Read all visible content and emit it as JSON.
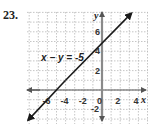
{
  "problem_number": "23.",
  "chart_data": {
    "type": "line",
    "title": "",
    "equation_label": "x − y = -5",
    "xlabel": "x",
    "ylabel": "y",
    "x_ticks": [
      "-6",
      "-4",
      "-2",
      "0",
      "2",
      "4"
    ],
    "y_ticks": [
      "6",
      "4",
      "2",
      "-2"
    ],
    "xlim": [
      -8,
      4.5
    ],
    "ylim": [
      -3.5,
      8
    ],
    "grid": true,
    "series": [
      {
        "name": "x - y = -5",
        "x": [
          -8,
          3
        ],
        "y": [
          -3,
          8
        ],
        "arrows": "both"
      }
    ],
    "colors": {
      "line": "#1a1a1a",
      "axis": "#7a7a7a",
      "grid": "#b8b8b8"
    }
  }
}
